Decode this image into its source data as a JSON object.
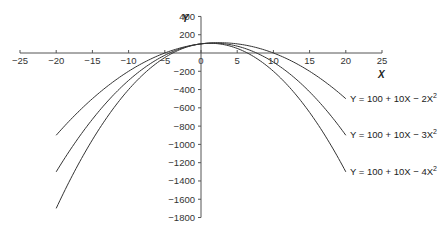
{
  "chart_data": {
    "type": "line",
    "title": "",
    "xlabel": "X",
    "ylabel": "Y",
    "xlim": [
      -25,
      25
    ],
    "ylim": [
      -1800,
      400
    ],
    "x_ticks": [
      -25,
      -20,
      -15,
      -10,
      -5,
      0,
      5,
      10,
      15,
      20,
      25
    ],
    "x_tick_labels": [
      "−25",
      "−20",
      "−15",
      "−10",
      "−5",
      "0",
      "5",
      "10",
      "15",
      "20",
      "25"
    ],
    "y_ticks": [
      400,
      200,
      -200,
      -400,
      -600,
      -800,
      -1000,
      -1200,
      -1400,
      -1600,
      -1800
    ],
    "y_tick_labels": [
      "400",
      "200",
      "−200",
      "−400",
      "−600",
      "−800",
      "−1000",
      "−1200",
      "−1400",
      "−1600",
      "−1800"
    ],
    "grid": false,
    "legend": "inline labels at right end of each curve",
    "x_range_plotted": [
      -20,
      20
    ],
    "series": [
      {
        "name": "Y = 100 + 10X − 2X²",
        "a": 100,
        "b": 10,
        "c": -2,
        "x": [
          -20,
          -15,
          -10,
          -5,
          0,
          2.5,
          5,
          10,
          15,
          20
        ],
        "values": [
          -900,
          -500,
          -300,
          0,
          100,
          112.5,
          100,
          0,
          -200,
          -500
        ]
      },
      {
        "name": "Y = 100 + 10X − 3X²",
        "a": 100,
        "b": 10,
        "c": -3,
        "x": [
          -20,
          -15,
          -10,
          -5,
          0,
          1.67,
          5,
          10,
          15,
          20
        ],
        "values": [
          -1300,
          -725,
          -300,
          -25,
          100,
          108.3,
          75,
          -100,
          -425,
          -900
        ]
      },
      {
        "name": "Y = 100 + 10X − 4X²",
        "a": 100,
        "b": 10,
        "c": -4,
        "x": [
          -20,
          -15,
          -10,
          -5,
          0,
          1.25,
          5,
          10,
          15,
          20
        ],
        "values": [
          -1700,
          -950,
          -400,
          -50,
          100,
          106.25,
          50,
          -200,
          -650,
          -1300
        ]
      }
    ]
  },
  "labels": {
    "x_axis": "X",
    "y_axis": "Y",
    "curve1": {
      "pre": "Y = 100 + 10X − 2X",
      "sup": "2"
    },
    "curve2": {
      "pre": "Y = 100 + 10X − 3X",
      "sup": "2"
    },
    "curve3": {
      "pre": "Y = 100 + 10X − 4X",
      "sup": "2"
    }
  },
  "style": {
    "line_color": "#333333",
    "axis_color": "#555555"
  }
}
